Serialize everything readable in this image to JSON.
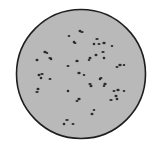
{
  "image": {
    "subject": "Petri dish / microscope field with scattered dark colonies",
    "alt": "Circular grey dish outlined in black containing scattered small dark specks",
    "colors": {
      "background": "#ffffff",
      "dish_fill": "#b9b9b9",
      "dish_outline": "#1e1e1e",
      "colony": "#2a2a2a"
    },
    "colony_count_visible": 52
  }
}
